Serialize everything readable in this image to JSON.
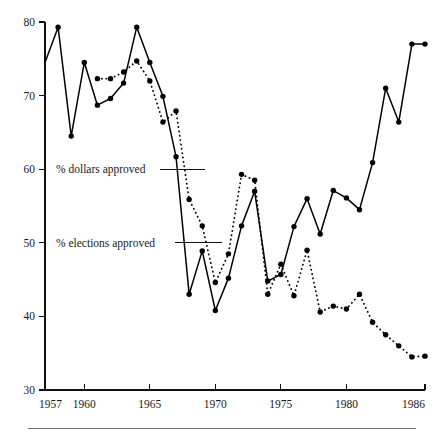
{
  "chart_data": {
    "type": "line",
    "title": "",
    "subtitle": "",
    "xlabel": "",
    "ylabel": "",
    "xlim": [
      1957,
      1986
    ],
    "ylim": [
      30,
      80
    ],
    "grid": false,
    "legend_position": "inline-annotations",
    "x_ticks": [
      1957,
      1960,
      1965,
      1970,
      1975,
      1980,
      1986
    ],
    "x_tick_labels": [
      "1957",
      "1960",
      "1965",
      "1970",
      "1975",
      "1980",
      "1986"
    ],
    "y_ticks": [
      30,
      40,
      50,
      60,
      70,
      80
    ],
    "y_tick_labels": [
      "30",
      "40",
      "50",
      "60",
      "70",
      "80"
    ],
    "series": [
      {
        "name": "% elections approved",
        "style": "solid",
        "marker": "filled-circle",
        "x": [
          1957,
          1958,
          1959,
          1960,
          1961,
          1962,
          1963,
          1964,
          1965,
          1966,
          1967,
          1968,
          1969,
          1970,
          1971,
          1972,
          1973,
          1974,
          1975,
          1976,
          1977,
          1978,
          1979,
          1980,
          1981,
          1982,
          1983,
          1984,
          1985,
          1986
        ],
        "values": [
          74.5,
          79.3,
          64.5,
          74.5,
          68.7,
          69.6,
          71.7,
          79.3,
          74.5,
          69.9,
          61.7,
          43.0,
          48.9,
          40.8,
          45.2,
          52.3,
          57.0,
          44.8,
          45.7,
          52.2,
          56.0,
          51.2,
          57.1,
          56.1,
          54.5,
          60.9,
          71.0,
          66.4,
          77.0,
          77.0
        ]
      },
      {
        "name": "% dollars approved",
        "style": "dotted",
        "marker": "filled-circle",
        "x": [
          1961,
          1962,
          1963,
          1964,
          1965,
          1966,
          1967,
          1968,
          1969,
          1970,
          1971,
          1972,
          1973,
          1974,
          1975,
          1976,
          1977,
          1978,
          1979,
          1980,
          1981,
          1982,
          1983,
          1984,
          1985,
          1986
        ],
        "values": [
          72.3,
          72.3,
          73.2,
          74.7,
          72.0,
          66.4,
          67.9,
          55.9,
          52.3,
          44.6,
          48.5,
          59.3,
          58.5,
          43.0,
          47.1,
          42.8,
          49.0,
          40.6,
          41.4,
          41.0,
          43.0,
          39.2,
          37.5,
          36.0,
          34.5,
          34.6
        ]
      }
    ],
    "annotations": [
      {
        "text": "% dollars approved",
        "value_axis": 60
      },
      {
        "text": "% elections approved",
        "value_axis": 50
      }
    ]
  },
  "labels": {
    "series_dollars": "% dollars approved",
    "series_elections": "% elections approved"
  }
}
